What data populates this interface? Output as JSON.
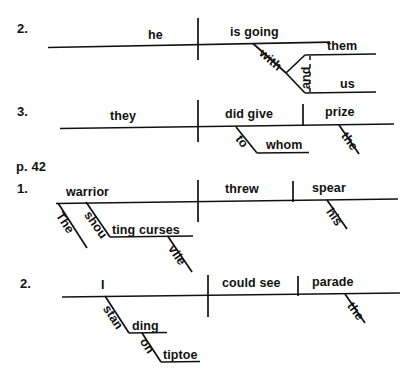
{
  "worksheet": {
    "title": "Sentence Diagramming Exercises",
    "page_marker": "p. 42",
    "ink_color": "#111111",
    "background_color": "#ffffff"
  },
  "groups": [
    {
      "id": "group-top",
      "items": [
        {
          "number": "2.",
          "subject": "he",
          "verb": "is going",
          "modifiers": [
            {
              "word": "with",
              "role": "preposition",
              "orientation": "diagonal"
            },
            {
              "word": "and",
              "role": "conjunction",
              "orientation": "vertical-dashed"
            },
            {
              "word": "them",
              "role": "object-of-preposition",
              "orientation": "horizontal"
            },
            {
              "word": "us",
              "role": "object-of-preposition",
              "orientation": "horizontal"
            }
          ]
        },
        {
          "number": "3.",
          "subject": "they",
          "verb": "did give",
          "direct_object": "prize",
          "modifiers": [
            {
              "word": "to",
              "role": "preposition",
              "orientation": "diagonal"
            },
            {
              "word": "whom",
              "role": "object-of-preposition",
              "orientation": "horizontal"
            },
            {
              "word": "the",
              "role": "article",
              "orientation": "diagonal"
            }
          ]
        }
      ]
    },
    {
      "id": "group-bottom",
      "items": [
        {
          "number": "1.",
          "subject": "warrior",
          "verb": "threw",
          "direct_object": "spear",
          "modifiers": [
            {
              "word": "The",
              "role": "article",
              "orientation": "diagonal"
            },
            {
              "word": "shou",
              "role": "participle-part-1",
              "orientation": "diagonal"
            },
            {
              "word": "ting curses",
              "role": "participle-part-2",
              "orientation": "horizontal"
            },
            {
              "word": "vile",
              "role": "adjective",
              "orientation": "diagonal"
            },
            {
              "word": "his",
              "role": "possessive",
              "orientation": "diagonal"
            }
          ]
        },
        {
          "number": "2.",
          "subject": "I",
          "verb": "could see",
          "direct_object": "parade",
          "modifiers": [
            {
              "word": "stan",
              "role": "participle-part-1",
              "orientation": "diagonal"
            },
            {
              "word": "ding",
              "role": "participle-part-2",
              "orientation": "horizontal"
            },
            {
              "word": "on",
              "role": "preposition",
              "orientation": "diagonal"
            },
            {
              "word": "tiptoe",
              "role": "object-of-preposition",
              "orientation": "horizontal"
            },
            {
              "word": "the",
              "role": "article",
              "orientation": "diagonal"
            }
          ]
        }
      ]
    },
    null
  ],
  "labels": {
    "num_2a": "2.",
    "num_3": "3.",
    "page_42": "p. 42",
    "num_1b": "1.",
    "num_2b": "2.",
    "he": "he",
    "is_going": "is going",
    "with": "with",
    "and": "and",
    "them": "them",
    "us": "us",
    "they": "they",
    "did_give": "did give",
    "prize": "prize",
    "to": "to",
    "whom": "whom",
    "the_1": "the",
    "warrior": "warrior",
    "threw": "threw",
    "spear": "spear",
    "The_cap": "The",
    "shou": "shou",
    "ting_curses": "ting  curses",
    "vile": "vile",
    "his": "his",
    "I": "I",
    "could_see": "could see",
    "parade": "parade",
    "stan": "stan",
    "ding": "ding",
    "on": "on",
    "tiptoe": "tiptoe",
    "the_2": "the"
  }
}
